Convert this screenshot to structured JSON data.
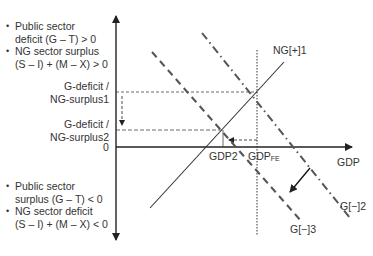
{
  "diagram": {
    "axes": {
      "x_label": "GDP",
      "y_origin_label": "0"
    },
    "upper_left_notes": [
      {
        "line1": "Public sector",
        "line2": "deficit (G – T) > 0"
      },
      {
        "line1": "NG sector surplus",
        "line2": "(S – I) + (M – X) > 0"
      }
    ],
    "lower_left_notes": [
      {
        "line1": "Public sector",
        "line2": "surplus (G – T) < 0"
      },
      {
        "line1": "NG sector deficit",
        "line2": "(S – I) + (M – X) < 0"
      }
    ],
    "y_levels": {
      "level1": {
        "line1": "G-deficit /",
        "line2": "NG-surplus1"
      },
      "level2": {
        "line1": "G-deficit /",
        "line2": "NG-surplus2"
      }
    },
    "x_markers": {
      "gdp2": "GDP2",
      "gdp_fe_main": "GDP",
      "gdp_fe_sub": "FE"
    },
    "curves": {
      "ng": "NG[+]1",
      "g2": "G[−]2",
      "g3": "G[−]3"
    },
    "colors": {
      "line": "#333333",
      "background": "#ffffff"
    }
  }
}
